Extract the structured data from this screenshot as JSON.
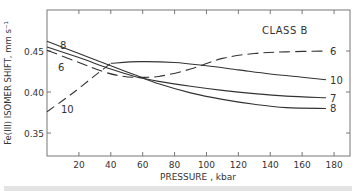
{
  "chart_data": {
    "type": "line",
    "title": "CLASS B",
    "xlabel": "PRESSURE , kbar",
    "ylabel": "Fe(III) ISOMER SHIFT, mm s⁻¹",
    "xlim": [
      0,
      190
    ],
    "ylim": [
      0.322,
      0.5
    ],
    "xticks": [
      20,
      40,
      60,
      80,
      100,
      120,
      140,
      160,
      180
    ],
    "xtick_labels": [
      "20",
      "40",
      "60",
      "80",
      "100",
      "120",
      "140",
      "160",
      "180"
    ],
    "yticks": [
      0.35,
      0.4,
      0.45
    ],
    "ytick_labels": [
      "0.35",
      "0.40",
      "0.45"
    ],
    "grid": false,
    "legend": "inline labels at curve ends",
    "series": [
      {
        "name": "8",
        "label_left": "8",
        "label_right": "8",
        "style": "solid",
        "x": [
          0,
          20,
          40,
          55,
          70,
          90,
          110,
          130,
          150,
          175
        ],
        "y": [
          0.462,
          0.447,
          0.432,
          0.421,
          0.41,
          0.399,
          0.391,
          0.385,
          0.381,
          0.38
        ]
      },
      {
        "name": "7",
        "label_right": "7",
        "style": "solid",
        "x": [
          0,
          20,
          40,
          55,
          70,
          90,
          110,
          130,
          150,
          175
        ],
        "y": [
          0.455,
          0.442,
          0.428,
          0.419,
          0.413,
          0.407,
          0.402,
          0.398,
          0.395,
          0.393
        ]
      },
      {
        "name": "6",
        "label_left": "6",
        "label_right": "6",
        "style": "dashed",
        "x": [
          0,
          20,
          35,
          45,
          55,
          70,
          90,
          110,
          130,
          150,
          175
        ],
        "y": [
          0.451,
          0.436,
          0.425,
          0.42,
          0.418,
          0.419,
          0.428,
          0.441,
          0.447,
          0.449,
          0.45
        ]
      },
      {
        "name": "10",
        "label_left": "10",
        "label_right": "10",
        "style": "dashed-then-solid",
        "x": [
          0,
          15,
          30,
          40,
          58,
          80,
          100,
          120,
          140,
          160,
          175
        ],
        "y": [
          0.376,
          0.397,
          0.42,
          0.435,
          0.437,
          0.436,
          0.432,
          0.427,
          0.422,
          0.418,
          0.415
        ],
        "dashed_until_x": 40
      }
    ]
  },
  "labels": {
    "class": "CLASS B",
    "xlabel": "PRESSURE , kbar",
    "ylabel": "Fe(III) ISOMER SHIFT, mm s⁻¹"
  }
}
